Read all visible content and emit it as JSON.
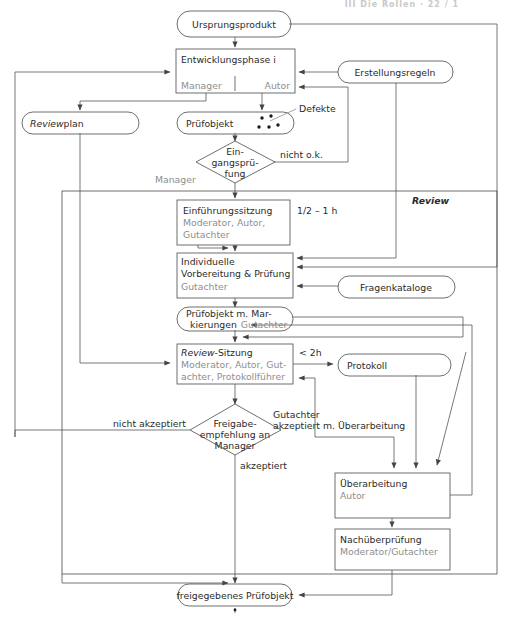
{
  "header": {
    "running_title": "III  Die Rollen · 22 / 1"
  },
  "diagram": {
    "frame_label": "Review",
    "nodes": [
      {
        "id": "ursprungsprodukt",
        "shape": "rounded",
        "label": "Ursprungsprodukt"
      },
      {
        "id": "entwicklungsphase",
        "shape": "rect",
        "label": "Entwicklungsphase i",
        "role_left": "Manager",
        "role_right": "Autor"
      },
      {
        "id": "erstellungsregeln",
        "shape": "rounded",
        "label": "Erstellungsregeln"
      },
      {
        "id": "reviewplan",
        "shape": "rounded",
        "label_italic": "Review",
        "label_rest": "plan"
      },
      {
        "id": "pruefobjekt",
        "shape": "rounded",
        "label": "Prüfobjekt",
        "annotation": "Defekte"
      },
      {
        "id": "eingangspruefung",
        "shape": "diamond",
        "line1": "Ein-",
        "line2": "gangsprü-",
        "line3": "fung",
        "role": "Manager",
        "edge_label": "nicht o.k."
      },
      {
        "id": "einfuehrungssitzung",
        "shape": "rect",
        "label": "Einführungssitzung",
        "role1": "Moderator, Autor,",
        "role2": "Gutachter",
        "duration": "1/2 – 1 h"
      },
      {
        "id": "individuelle-vorbereitung",
        "shape": "rect",
        "label1": "Individuelle",
        "label2": "Vorbereitung & Prüfung",
        "role": "Gutachter"
      },
      {
        "id": "fragenkataloge",
        "shape": "rounded",
        "label": "Fragenkataloge"
      },
      {
        "id": "pruefobjekt-markierungen",
        "shape": "rounded",
        "label1": "Prüfobjekt m. Mar-",
        "label2": "kierungen",
        "role": "Gutachter"
      },
      {
        "id": "review-sitzung",
        "shape": "rect",
        "label_italic": "Review",
        "label_rest": "-Sitzung",
        "role1": "Moderator, Autor, Gut-",
        "role2": "achter, Protokollführer",
        "duration": "< 2h"
      },
      {
        "id": "protokoll",
        "shape": "rounded",
        "label": "Protokoll"
      },
      {
        "id": "freigabeempfehlung",
        "shape": "diamond",
        "line1": "Freigabe-",
        "line2": "empfehlung an",
        "line3": "Manager"
      },
      {
        "id": "ueberarbeitung",
        "shape": "rect",
        "label": "Überarbeitung",
        "role": "Autor"
      },
      {
        "id": "nachueberpruefung",
        "shape": "rect",
        "label": "Nachüberprüfung",
        "role": "Moderator/Gutachter"
      },
      {
        "id": "freigegebenes-pruefobjekt",
        "shape": "rounded",
        "label": "freigegebenes Prüfobjekt"
      }
    ],
    "edge_labels": {
      "nicht_ok": "nicht o.k.",
      "nicht_akzeptiert": "nicht akzeptiert",
      "akzeptiert": "akzeptiert",
      "gutachter": "Gutachter",
      "akzeptiert_ueberarbeitung": "akzeptiert m. Überarbeitung",
      "defekte": "Defekte",
      "dauer_einfuehrung": "1/2 – 1 h",
      "dauer_review": "< 2h"
    },
    "colors": {
      "stroke": "#4a4a4a",
      "text": "#2b2b2b",
      "text_muted": "#8e8e8e",
      "background": "#ffffff"
    }
  }
}
